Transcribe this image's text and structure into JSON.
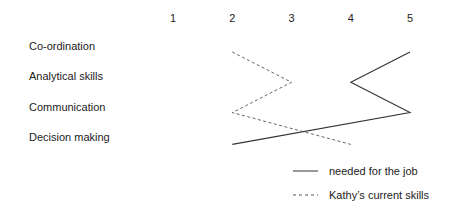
{
  "chart_data": {
    "type": "line",
    "title": "",
    "xlabel": "",
    "ylabel": "",
    "x_ticks": [
      "1",
      "2",
      "3",
      "4",
      "5"
    ],
    "xlim": [
      1,
      5
    ],
    "categories": [
      "Co-ordination",
      "Analytical skills",
      "Communication",
      "Decision making"
    ],
    "orientation": "horizontal-profile",
    "grid": false,
    "legend_position": "bottom-right",
    "series": [
      {
        "name": "needed for the job",
        "style": "solid",
        "values": [
          5,
          4,
          5,
          2
        ]
      },
      {
        "name": "Kathy’s current skills",
        "style": "dashed",
        "values": [
          2,
          3,
          2,
          4
        ]
      }
    ]
  }
}
